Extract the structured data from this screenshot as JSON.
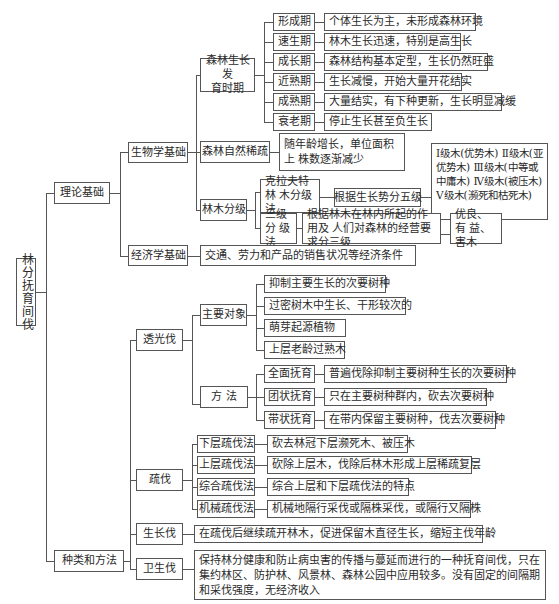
{
  "root": {
    "label": "林分抚育间伐"
  },
  "level1": {
    "theory": "理论基础",
    "types": "种类和方法"
  },
  "theory": {
    "biology": "生物学基础",
    "economics": "经济学基础",
    "economics_desc": "交通、劳力和产品的销售状况等经济条件",
    "growth_periods": {
      "label": "森林生长发育时期",
      "items": [
        {
          "name": "形成期",
          "desc": "个体生长为主，未形成森林环境"
        },
        {
          "name": "速生期",
          "desc": "林木生长迅速，特别是高生长"
        },
        {
          "name": "成长期",
          "desc": "森林结构基本定型，生长仍然旺盛"
        },
        {
          "name": "近熟期",
          "desc": "生长减慢，开始大量开花结实"
        },
        {
          "name": "成熟期",
          "desc": "大量结实，有下种更新，生长明显减缓"
        },
        {
          "name": "衰老期",
          "desc": "停止生长甚至负生长"
        }
      ]
    },
    "self_thinning": {
      "label": "森林自然稀疏",
      "desc": "随年龄增长，单位面积上\n株数逐渐减少"
    },
    "tree_classification": {
      "label": "林木分级",
      "kraft": {
        "label": "克拉夫特林\n木分级法",
        "basis": "根据生长势分五级",
        "grades": "Ⅰ级木(优势木)\nⅡ级木(亚优势木)\nⅢ级木(中等或中庸木)\nⅣ级木(被压木)\nⅤ级木(濒死和枯死木)"
      },
      "three_class": {
        "label": "三级分\n级法",
        "basis": "根据林木在林内所起的作用及\n人们对森林的经营要求分三级",
        "grades": "优良、有\n益、害木"
      }
    }
  },
  "types": {
    "release_cutting": {
      "label": "透光伐",
      "targets": {
        "label": "主要对象",
        "items": [
          "抑制主要生长的次要树种",
          "过密树木中生长、干形较次的",
          "萌芽起源植物",
          "上层老龄过熟木"
        ]
      },
      "methods": {
        "label": "方 法",
        "items": [
          {
            "name": "全面抚育",
            "desc": "普遍伐除抑制主要树种生长的次要树种"
          },
          {
            "name": "团状抚育",
            "desc": "只在主要树种群内，砍去次要树种"
          },
          {
            "name": "带状抚育",
            "desc": "在带内保留主要树种，伐去次要树种"
          }
        ]
      }
    },
    "thinning": {
      "label": "疏伐",
      "items": [
        {
          "name": "下层疏伐法",
          "desc": "砍去林冠下层濒死木、被压木"
        },
        {
          "name": "上层疏伐法",
          "desc": "砍除上层木，伐除后林木形成上层稀疏复层"
        },
        {
          "name": "综合疏伐法",
          "desc": "综合上层和下层疏伐法的特点"
        },
        {
          "name": "机械疏伐法",
          "desc": "机械地隔行采伐或隔株采伐，或隔行又隔株"
        }
      ]
    },
    "increment_felling": {
      "label": "生长伐",
      "desc": "在疏伐后继续疏开林木，促进保留木直径生长，缩短主伐年龄"
    },
    "sanitation_felling": {
      "label": "卫生伐",
      "desc": "保持林分健康和防止病虫害的传播与蔓延而进行的一种抚育间伐，只在集约林区、防护林、风景林、森林公园中应用较多。没有固定的间隔期和采伐强度，无经济收入"
    }
  }
}
